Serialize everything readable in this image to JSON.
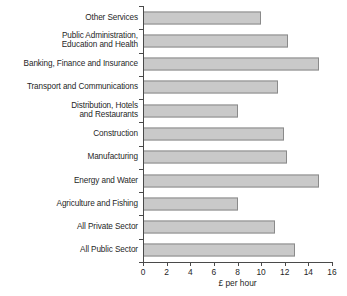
{
  "chart_data": {
    "type": "bar",
    "orientation": "horizontal",
    "title": "",
    "xlabel": "£ per hour",
    "ylabel": "",
    "xlim": [
      0,
      16
    ],
    "xticks": [
      "0",
      "2",
      "4",
      "6",
      "8",
      "10",
      "12",
      "14",
      "16"
    ],
    "xtick_values": [
      0,
      2,
      4,
      6,
      8,
      10,
      12,
      14,
      16
    ],
    "grid": false,
    "legend": null,
    "bar_color": "#c9c9c9",
    "bar_border_color": "#8a8a8a",
    "axis_color": "#4a4a4a",
    "categories": [
      "Other Services",
      "Public Administration,\nEducation and Health",
      "Banking, Finance and Insurance",
      "Transport and Communications",
      "Distribution, Hotels\nand Restaurants",
      "Construction",
      "Manufacturing",
      "Energy and Water",
      "Agriculture and Fishing",
      "All Private Sector",
      "All Public Sector"
    ],
    "values": [
      10.0,
      12.3,
      14.9,
      11.4,
      8.0,
      11.9,
      12.2,
      14.9,
      8.05,
      11.2,
      12.9
    ]
  }
}
